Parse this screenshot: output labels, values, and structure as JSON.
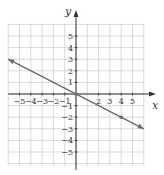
{
  "chart_data": {
    "type": "line",
    "title": "",
    "xlabel": "x",
    "ylabel": "y",
    "xlim": [
      -6,
      6
    ],
    "ylim": [
      -6,
      6
    ],
    "grid": true,
    "x_ticks": [
      -5,
      -4,
      -3,
      -2,
      -1,
      2,
      3,
      4,
      5
    ],
    "x_tick_labels": [
      "−5",
      "−4",
      "−3",
      "−2",
      "−1",
      "2",
      "3",
      "4",
      "5"
    ],
    "y_ticks": [
      5,
      4,
      3,
      2,
      1,
      -1,
      -2,
      -3,
      -4,
      -5
    ],
    "y_tick_labels": [
      "5",
      "4",
      "3",
      "2",
      "1",
      "−1",
      "−2",
      "−3",
      "−4",
      "−5"
    ],
    "series": [
      {
        "name": "line",
        "equation": "y = -x/2",
        "x": [
          -6,
          0,
          4,
          6
        ],
        "y": [
          3,
          0,
          -2,
          -3
        ],
        "marked_points": [
          [
            0,
            0
          ],
          [
            4,
            -2
          ]
        ],
        "arrows_both_ends": true
      }
    ],
    "colors": {
      "grid": "#c8c8c8",
      "axes": "#333333",
      "line": "#6a6a6a",
      "background": "#ffffff"
    }
  }
}
